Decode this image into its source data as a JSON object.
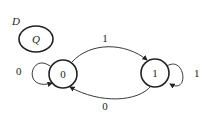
{
  "legend": {
    "input_label": "D",
    "state_label": "Q"
  },
  "states": [
    {
      "id": "0",
      "label": "0"
    },
    {
      "id": "1",
      "label": "1"
    }
  ],
  "transitions": [
    {
      "from": "0",
      "to": "0",
      "label": "0"
    },
    {
      "from": "0",
      "to": "1",
      "label": "1"
    },
    {
      "from": "1",
      "to": "1",
      "label": "1"
    },
    {
      "from": "1",
      "to": "0",
      "label": "0"
    }
  ],
  "colors": {
    "stroke": "#222222",
    "background": "#ffffff"
  }
}
